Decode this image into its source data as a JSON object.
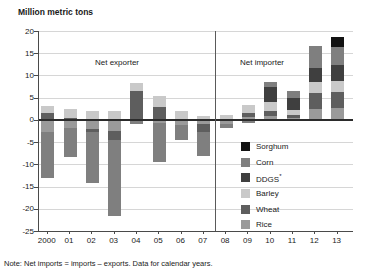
{
  "title": "Million metric tons",
  "note": "Note: Net imports = imports – exports. Data for calendar years.",
  "annotations": {
    "net_exporter": "Net exporter",
    "net_importer": "Net importer"
  },
  "chart_data": {
    "type": "bar",
    "subtype": "diverging-stacked",
    "title": "Million metric tons",
    "categories": [
      "2000",
      "01",
      "02",
      "03",
      "04",
      "05",
      "06",
      "07",
      "08",
      "09",
      "10",
      "11",
      "12",
      "13"
    ],
    "series": [
      {
        "name": "Sorghum",
        "color": "#121212",
        "values": [
          0,
          0,
          0,
          0,
          0,
          0,
          0,
          0,
          0,
          0,
          0,
          0,
          0,
          2.4
        ]
      },
      {
        "name": "Corn",
        "color": "#7f7f7f",
        "values": [
          -10.3,
          -6.6,
          -11.4,
          -17.0,
          -0.7,
          -8.7,
          -3.3,
          -5.3,
          -1.0,
          -0.6,
          1.3,
          1.7,
          5.1,
          3.9
        ]
      },
      {
        "name": "DDGS",
        "sup": "*",
        "color": "#3f3f3f",
        "values": [
          0,
          0,
          0,
          0,
          0,
          0,
          0,
          0,
          0,
          0,
          3.2,
          2.65,
          3.1,
          3.7
        ]
      },
      {
        "name": "Barley",
        "color": "#c9c9c9",
        "values": [
          1.7,
          1.9,
          2.1,
          1.9,
          1.9,
          2.4,
          1.9,
          0.9,
          1.1,
          1.75,
          2.0,
          1.15,
          2.5,
          2.4
        ]
      },
      {
        "name": "Wheat",
        "color": "#5e5e5e",
        "values": [
          1.5,
          0.5,
          -0.8,
          -2.0,
          6.4,
          3.0,
          0,
          -1.9,
          0,
          0.9,
          1.2,
          0.6,
          3.5,
          3.6
        ]
      },
      {
        "name": "Rice",
        "color": "#9a9a9a",
        "values": [
          -2.8,
          -1.8,
          -2.0,
          -2.6,
          -0.3,
          -0.7,
          -1.2,
          -0.9,
          -0.9,
          0.7,
          0.9,
          0.5,
          2.5,
          2.7
        ]
      }
    ],
    "stack_order_bottom_to_top": [
      "Rice",
      "Wheat",
      "Barley",
      "DDGS",
      "Corn",
      "Sorghum"
    ],
    "xlabel": "",
    "ylabel": "Million metric tons",
    "ylim": [
      -25,
      20
    ],
    "y_ticks": [
      20,
      15,
      10,
      5,
      0,
      -5,
      -10,
      -15,
      -20,
      -25
    ],
    "grid": true,
    "divider_after_category": "07",
    "legend_position": "right-middle",
    "legend_order": [
      "Sorghum",
      "Corn",
      "DDGS",
      "Barley",
      "Wheat",
      "Rice"
    ]
  }
}
